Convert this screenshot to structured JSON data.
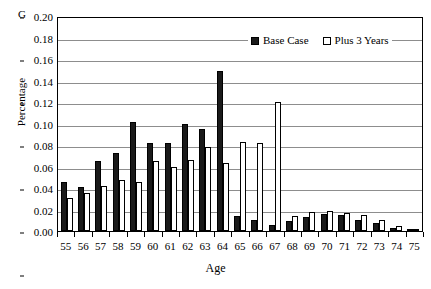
{
  "corner_label": "G",
  "legend": {
    "position": "top-right-inside",
    "entries": [
      {
        "label": "Base Case",
        "swatch": "filled-square-icon",
        "color": "#1a1a1a"
      },
      {
        "label": "Plus 3 Years",
        "swatch": "hollow-square-icon",
        "color": "#ffffff"
      }
    ]
  },
  "chart_data": {
    "type": "bar",
    "title": "",
    "subtitle": "",
    "xlabel": "Age",
    "ylabel": "Percentage",
    "ylim": [
      0.0,
      0.2
    ],
    "ytick_labels": [
      "0.20",
      "0.18",
      "0.16",
      "0.14",
      "0.12",
      "0.10",
      "0.08",
      "0.06",
      "0.04",
      "0.02",
      "0.00"
    ],
    "ytick_values": [
      0.2,
      0.18,
      0.16,
      0.14,
      0.12,
      0.1,
      0.08,
      0.06,
      0.04,
      0.02,
      0.0
    ],
    "grid": true,
    "grid_axis": "y",
    "legend_position": "upper right",
    "categories": [
      "55",
      "56",
      "57",
      "58",
      "59",
      "60",
      "61",
      "62",
      "63",
      "64",
      "65",
      "66",
      "67",
      "68",
      "69",
      "70",
      "71",
      "72",
      "73",
      "74",
      "75"
    ],
    "series": [
      {
        "name": "Base Case",
        "color": "#1a1a1a",
        "values": [
          0.046,
          0.041,
          0.065,
          0.073,
          0.101,
          0.082,
          0.082,
          0.1,
          0.095,
          0.149,
          0.014,
          0.01,
          0.006,
          0.009,
          0.013,
          0.016,
          0.015,
          0.01,
          0.007,
          0.003,
          0.002
        ]
      },
      {
        "name": "Plus 3 Years",
        "color": "#ffffff",
        "values": [
          0.031,
          0.035,
          0.042,
          0.047,
          0.046,
          0.065,
          0.06,
          0.066,
          0.078,
          0.063,
          0.083,
          0.082,
          0.12,
          0.014,
          0.018,
          0.019,
          0.017,
          0.015,
          0.01,
          0.005,
          0.002
        ]
      }
    ]
  }
}
